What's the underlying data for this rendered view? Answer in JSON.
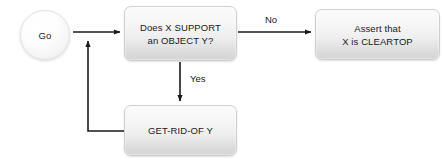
{
  "diagram": {
    "background_color": "#ffffff",
    "line_color": "#1a1a1a",
    "node_fill_top": "#fbfbfb",
    "node_fill_bottom": "#d4d4d4",
    "node_border_color": "#cfcfcf",
    "text_color": "#1a1a1a"
  },
  "nodes": {
    "start": {
      "label": "Go",
      "shape": "circle"
    },
    "decision": {
      "label": "Does X SUPPORT\nan OBJECT Y?",
      "line1": "Does X SUPPORT",
      "line2": "an OBJECT Y?",
      "shape": "rounded-rect"
    },
    "assert": {
      "label": "Assert that\nX is CLEARTOP",
      "line1": "Assert that",
      "line2": "X is CLEARTOP",
      "shape": "rounded-rect"
    },
    "getridof": {
      "label": "GET-RID-OF Y",
      "shape": "rounded-rect"
    }
  },
  "edges": [
    {
      "id": "start-to-decision",
      "from": "start",
      "to": "decision",
      "label": "",
      "direction": "right"
    },
    {
      "id": "decision-to-assert",
      "from": "decision",
      "to": "assert",
      "label": "No",
      "direction": "right"
    },
    {
      "id": "decision-to-getridof",
      "from": "decision",
      "to": "getridof",
      "label": "Yes",
      "direction": "down"
    },
    {
      "id": "getridof-loop-back",
      "from": "getridof",
      "to": "start-to-decision",
      "label": "",
      "direction": "up"
    }
  ],
  "edge_labels": {
    "no": "No",
    "yes": "Yes"
  }
}
